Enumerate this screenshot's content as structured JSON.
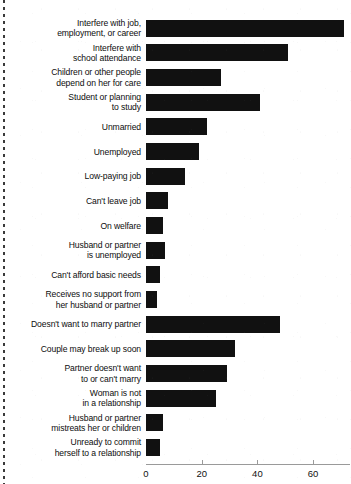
{
  "chart_data": {
    "type": "bar",
    "orientation": "horizontal",
    "title": "",
    "subtitle": "",
    "xlabel": "",
    "ylabel": "",
    "xlim": [
      0,
      73
    ],
    "xticks": [
      0,
      20,
      40,
      60
    ],
    "xtick_labels": [
      "0",
      "20",
      "40",
      "60"
    ],
    "grid": false,
    "legend": null,
    "bar_color": "#111111",
    "axis_color": "#9a9a9a",
    "categories": [
      "Interfere with job,\nemployment, or career",
      "Interfere with\nschool attendance",
      "Children or other people\ndepend on her for care",
      "Student or planning\nto study",
      "Unmarried",
      "Unemployed",
      "Low-paying job",
      "Can't leave job",
      "On welfare",
      "Husband or partner\nis unemployed",
      "Can't afford basic needs",
      "Receives no support from\nher husband or partner",
      "Doesn't want to marry partner",
      "Couple may break up soon",
      "Partner doesn't want\nto or can't marry",
      "Woman is not\nin a relationship",
      "Husband or partner\nmistreats her or children",
      "Unready to commit\nherself to a relationship"
    ],
    "values": [
      71,
      51,
      27,
      41,
      22,
      19,
      14,
      8,
      6,
      7,
      5,
      4,
      48,
      32,
      29,
      25,
      6,
      5
    ]
  }
}
